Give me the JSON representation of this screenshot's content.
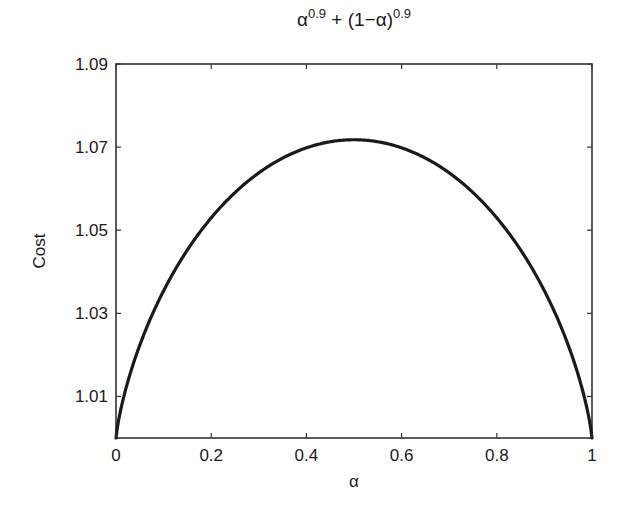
{
  "chart_data": {
    "type": "line",
    "title_parts": {
      "base1": "α",
      "exp1": "0.9",
      "mid": " + (1−α)",
      "exp2": "0.9"
    },
    "xlabel": "α",
    "ylabel": "Cost",
    "xlim": [
      0,
      1
    ],
    "ylim": [
      1.0,
      1.09
    ],
    "xticks": [
      0,
      0.2,
      0.4,
      0.6,
      0.8,
      1
    ],
    "xtick_labels": [
      "0",
      "0.2",
      "0.4",
      "0.6",
      "0.8",
      "1"
    ],
    "yticks": [
      1.01,
      1.03,
      1.05,
      1.07,
      1.09
    ],
    "ytick_labels": [
      "1.01",
      "1.03",
      "1.05",
      "1.07",
      "1.09"
    ],
    "grid": false,
    "legend": null,
    "series": [
      {
        "name": "α^0.9 + (1−α)^0.9",
        "x": [
          0,
          0.01,
          0.025,
          0.05,
          0.075,
          0.1,
          0.15,
          0.2,
          0.25,
          0.3,
          0.35,
          0.4,
          0.45,
          0.5,
          0.55,
          0.6,
          0.65,
          0.7,
          0.75,
          0.8,
          0.85,
          0.9,
          0.925,
          0.95,
          0.975,
          0.99,
          1
        ],
        "values": [
          1.0,
          1.0071,
          1.0156,
          1.0266,
          1.0351,
          1.0419,
          1.0522,
          1.0595,
          1.0646,
          1.0681,
          1.0703,
          1.0715,
          1.0719,
          1.0718,
          1.0719,
          1.0715,
          1.0703,
          1.0681,
          1.0646,
          1.0595,
          1.0522,
          1.0419,
          1.0351,
          1.0266,
          1.0156,
          1.0071,
          1.0
        ],
        "color": "#1a1a1a"
      }
    ]
  },
  "plot": {
    "box": {
      "left": 116,
      "top": 64,
      "right": 592,
      "bottom": 438
    },
    "line_color": "#1a1a1a",
    "axis_color": "#333333"
  }
}
